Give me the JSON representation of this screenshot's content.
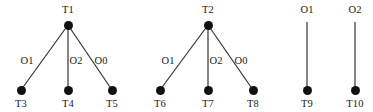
{
  "figure": {
    "title": "",
    "background_color": "#ffffff",
    "node_color": "#111111",
    "edge_color": "#333333",
    "text_color": "#1a1a1a",
    "width": 373,
    "height": 112
  },
  "components": [
    {
      "id": "tree-1",
      "root": {
        "label": "T1",
        "x": 68,
        "y": 25,
        "label_x": 68,
        "label_y": 4
      },
      "children": [
        {
          "label": "T3",
          "x": 21,
          "y": 90,
          "label_x": 21,
          "label_y": 98,
          "edge_label": "O1",
          "edge_label_x": 27,
          "edge_label_y": 55
        },
        {
          "label": "T4",
          "x": 68,
          "y": 90,
          "label_x": 68,
          "label_y": 98,
          "edge_label": "O2",
          "edge_label_x": 76,
          "edge_label_y": 55
        },
        {
          "label": "T5",
          "x": 112,
          "y": 90,
          "label_x": 112,
          "label_y": 98,
          "edge_label": "O0",
          "edge_label_x": 101,
          "edge_label_y": 55
        }
      ]
    },
    {
      "id": "tree-2",
      "root": {
        "label": "T2",
        "x": 208,
        "y": 25,
        "label_x": 208,
        "label_y": 4
      },
      "children": [
        {
          "label": "T6",
          "x": 160,
          "y": 90,
          "label_x": 160,
          "label_y": 98,
          "edge_label": "O1",
          "edge_label_x": 168,
          "edge_label_y": 55
        },
        {
          "label": "T7",
          "x": 208,
          "y": 90,
          "label_x": 208,
          "label_y": 98,
          "edge_label": "O2",
          "edge_label_x": 216,
          "edge_label_y": 55
        },
        {
          "label": "T8",
          "x": 253,
          "y": 90,
          "label_x": 253,
          "label_y": 98,
          "edge_label": "O0",
          "edge_label_x": 241,
          "edge_label_y": 55
        }
      ]
    },
    {
      "id": "edge-3",
      "top_label": "O1",
      "top_label_x": 307,
      "top_label_y": 4,
      "line_x": 307,
      "line_y1": 22,
      "line_y2": 90,
      "node": {
        "label": "T9",
        "x": 307,
        "y": 90,
        "label_x": 307,
        "label_y": 98
      }
    },
    {
      "id": "edge-4",
      "top_label": "O2",
      "top_label_x": 355,
      "top_label_y": 4,
      "line_x": 355,
      "line_y1": 22,
      "line_y2": 90,
      "node": {
        "label": "T10",
        "x": 355,
        "y": 90,
        "label_x": 355,
        "label_y": 98
      }
    }
  ]
}
